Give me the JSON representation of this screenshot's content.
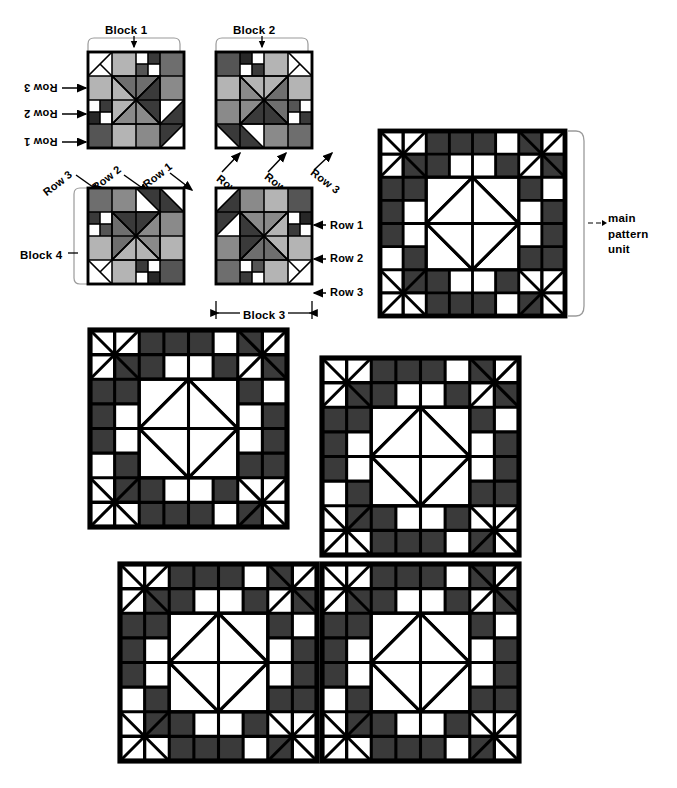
{
  "diagram": {
    "labels": {
      "block1": "Block 1",
      "block2": "Block 2",
      "block3": "Block 3",
      "block4": "Block 4",
      "row1": "Row 1",
      "row2": "Row 2",
      "row3": "Row 3",
      "main_pattern_unit_line1": "main",
      "main_pattern_unit_line2": "pattern",
      "main_pattern_unit_line3": "unit"
    },
    "colors": {
      "ink": "#000000",
      "paper": "#ffffff",
      "dark_patch": "#3a3a3a",
      "mid_patch": "#6e6e6e",
      "light_patch": "#b4b4b4",
      "pale_patch": "#f2f2f2",
      "bracket": "#9a9a9a"
    },
    "fabric_blocks": [
      {
        "name": "Block 1",
        "rotation_deg": 0,
        "row_label_side": "left-inverted",
        "x": 88,
        "y": 52,
        "size": 96
      },
      {
        "name": "Block 2",
        "rotation_deg": 90,
        "row_label_side": "bottom",
        "x": 216,
        "y": 52,
        "size": 96
      },
      {
        "name": "Block 4",
        "rotation_deg": 270,
        "row_label_side": "top-diagonal",
        "x": 88,
        "y": 188,
        "size": 96
      },
      {
        "name": "Block 3",
        "rotation_deg": 180,
        "row_label_side": "right",
        "x": 216,
        "y": 188,
        "size": 96
      }
    ],
    "pattern_units": [
      {
        "id": "main-pattern-unit",
        "labeled": true,
        "x": 380,
        "y": 131,
        "size": 185
      },
      {
        "id": "pattern-unit-2",
        "labeled": false,
        "x": 90,
        "y": 330,
        "size": 197
      },
      {
        "id": "pattern-unit-3",
        "labeled": false,
        "x": 322,
        "y": 358,
        "size": 197
      },
      {
        "id": "pattern-unit-4",
        "labeled": false,
        "x": 120,
        "y": 564,
        "size": 197
      },
      {
        "id": "pattern-unit-5",
        "labeled": false,
        "x": 322,
        "y": 564,
        "size": 197
      }
    ]
  },
  "chart_data": {
    "type": "diagram",
    "unit_grid": 8,
    "block_grid": 4,
    "block_cells": [
      [
        "corner-hourglass",
        "blank",
        "dark",
        "dark"
      ],
      [
        "blank",
        "dark",
        "blank",
        "blank"
      ],
      [
        "dark",
        "blank",
        "blank",
        "blank"
      ],
      [
        "blank",
        "blank",
        "blank",
        "center-diamond"
      ]
    ]
  }
}
